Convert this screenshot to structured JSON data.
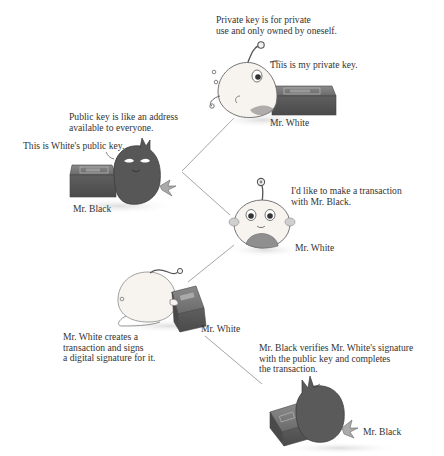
{
  "panels": [
    {
      "id": "private-key",
      "caption": "Private key is for private\nuse and only owned by oneself.",
      "speech": "This is my private key.",
      "character_label": "Mr. White",
      "character": "white-creature",
      "object": "private-key-box"
    },
    {
      "id": "public-key",
      "caption": "Public key is like an address\navailable to everyone.",
      "speech": "This is White's public key.",
      "character_label": "Mr. Black",
      "character": "black-creature",
      "object": "public-key-box"
    },
    {
      "id": "transaction-intent",
      "caption": "",
      "speech": "I'd like to make a transaction\nwith Mr. Black.",
      "character_label": "Mr. White",
      "character": "white-creature"
    },
    {
      "id": "sign",
      "caption": "Mr. White creates a\ntransaction and signs\na digital signature for it.",
      "speech": "",
      "character_label": "Mr. White",
      "character": "white-creature",
      "object": "signing-box"
    },
    {
      "id": "verify",
      "caption": "Mr. Black verifies Mr. White's signature\nwith the public key and completes\nthe transaction.",
      "speech": "",
      "character_label": "Mr. Black",
      "character": "black-creature",
      "object": "verifying-box"
    }
  ],
  "colors": {
    "white_creature": "#f7f4ef",
    "black_creature": "#555555",
    "box": "#6e6e6e",
    "connector": "#9a9a9a"
  }
}
